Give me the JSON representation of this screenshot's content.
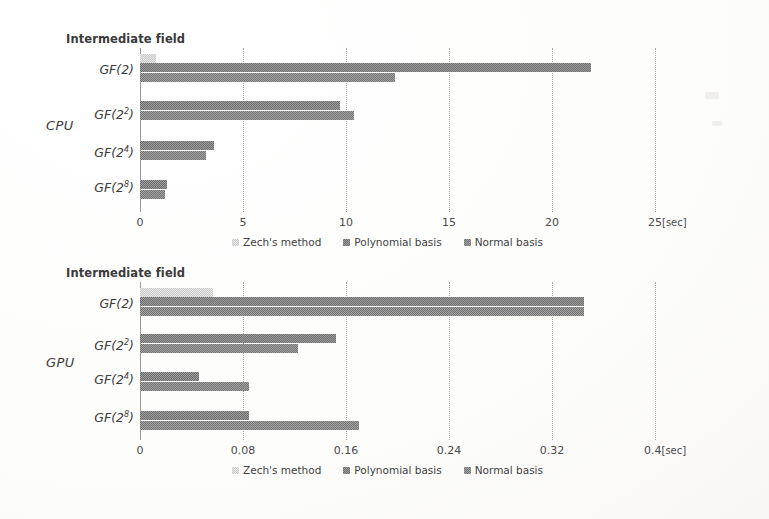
{
  "chart_data": [
    {
      "type": "bar",
      "orientation": "horizontal",
      "title": "CPU",
      "axis_title": "Intermediate field",
      "xlabel": "[sec]",
      "ylabel": "",
      "categories": [
        "GF(2)",
        "GF(2^2)",
        "GF(2^4)",
        "GF(2^8)"
      ],
      "category_labels": [
        {
          "base": "GF(2",
          "sup": "",
          "close": ")"
        },
        {
          "base": "GF(2",
          "sup": "2",
          "close": ")"
        },
        {
          "base": "GF(2",
          "sup": "4",
          "close": ")"
        },
        {
          "base": "GF(2",
          "sup": "8",
          "close": ")"
        }
      ],
      "series": [
        {
          "name": "Zech's method",
          "values": [
            0.8,
            null,
            null,
            null
          ]
        },
        {
          "name": "Polynomial basis",
          "values": [
            21.9,
            9.7,
            3.6,
            1.3
          ]
        },
        {
          "name": "Normal basis",
          "values": [
            12.4,
            10.4,
            3.2,
            1.2
          ]
        }
      ],
      "xticks": [
        0,
        5,
        10,
        15,
        20,
        25
      ],
      "xtick_labels": [
        "0",
        "5",
        "10",
        "15",
        "20",
        "25"
      ],
      "xlim": [
        0,
        25
      ],
      "unit_suffix": "[sec]",
      "grid": true,
      "legend_position": "bottom"
    },
    {
      "type": "bar",
      "orientation": "horizontal",
      "title": "GPU",
      "axis_title": "Intermediate field",
      "xlabel": "[sec]",
      "ylabel": "",
      "categories": [
        "GF(2)",
        "GF(2^2)",
        "GF(2^4)",
        "GF(2^8)"
      ],
      "category_labels": [
        {
          "base": "GF(2",
          "sup": "",
          "close": ")"
        },
        {
          "base": "GF(2",
          "sup": "2",
          "close": ")"
        },
        {
          "base": "GF(2",
          "sup": "4",
          "close": ")"
        },
        {
          "base": "GF(2",
          "sup": "8",
          "close": ")"
        }
      ],
      "series": [
        {
          "name": "Zech's method",
          "values": [
            0.057,
            null,
            null,
            null
          ]
        },
        {
          "name": "Polynomial basis",
          "values": [
            0.345,
            0.152,
            0.046,
            0.085
          ]
        },
        {
          "name": "Normal basis",
          "values": [
            0.345,
            0.123,
            0.085,
            0.17
          ]
        }
      ],
      "xticks": [
        0,
        0.08,
        0.16,
        0.24,
        0.32,
        0.4
      ],
      "xtick_labels": [
        "0",
        "0.08",
        "0.16",
        "0.24",
        "0.32",
        "0.4"
      ],
      "xlim": [
        0,
        0.4
      ],
      "unit_suffix": "[sec]",
      "grid": true,
      "legend_position": "bottom"
    }
  ],
  "cpu": {
    "axis_title": "Intermediate field",
    "series_title": "CPU",
    "labels": {
      "c0_base": "GF(2",
      "c0_sup": "",
      "c0_close": ")",
      "c1_base": "GF(2",
      "c1_sup": "2",
      "c1_close": ")",
      "c2_base": "GF(2",
      "c2_sup": "4",
      "c2_close": ")",
      "c3_base": "GF(2",
      "c3_sup": "8",
      "c3_close": ")"
    },
    "ticks": [
      "0",
      "5",
      "10",
      "15",
      "20",
      "25"
    ],
    "unit": "[sec]",
    "legend": {
      "zech": "Zech's method",
      "poly": "Polynomial basis",
      "norm": "Normal basis"
    }
  },
  "gpu": {
    "axis_title": "Intermediate field",
    "series_title": "GPU",
    "labels": {
      "c0_base": "GF(2",
      "c0_sup": "",
      "c0_close": ")",
      "c1_base": "GF(2",
      "c1_sup": "2",
      "c1_close": ")",
      "c2_base": "GF(2",
      "c2_sup": "4",
      "c2_close": ")",
      "c3_base": "GF(2",
      "c3_sup": "8",
      "c3_close": ")"
    },
    "ticks": [
      "0",
      "0.08",
      "0.16",
      "0.24",
      "0.32",
      "0.4"
    ],
    "unit": "[sec]",
    "legend": {
      "zech": "Zech's method",
      "poly": "Polynomial basis",
      "norm": "Normal basis"
    }
  }
}
